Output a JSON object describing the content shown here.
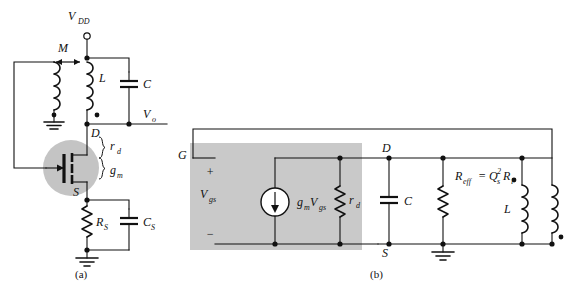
{
  "figure": {
    "background_color": "#ffffff",
    "line_color": "#111111",
    "shade_color": "#c9c9c9"
  },
  "panel_a": {
    "caption": "(a)",
    "labels": {
      "supply": "V",
      "supply_sub": "DD",
      "mutual": "M",
      "inductor": "L",
      "capacitor": "C",
      "output": "V",
      "output_sub": "o",
      "gate": "G",
      "drain": "D",
      "source": "S",
      "rd": "r",
      "rd_sub": "d",
      "gm": "g",
      "gm_sub": "m",
      "source_resistor": "R",
      "source_resistor_sub": "S",
      "source_capacitor": "C",
      "source_capacitor_sub": "S"
    },
    "components": [
      {
        "name": "supply-terminal",
        "type": "open-terminal",
        "label": "V_DD"
      },
      {
        "name": "primary-inductor",
        "type": "inductor",
        "label": "L"
      },
      {
        "name": "secondary-inductor",
        "type": "inductor",
        "label": ""
      },
      {
        "name": "mutual-coupling",
        "type": "coupling-arrow",
        "label": "M"
      },
      {
        "name": "tank-capacitor",
        "type": "capacitor",
        "label": "C"
      },
      {
        "name": "mosfet",
        "type": "n-channel-fet",
        "label": "G/D/S"
      },
      {
        "name": "source-resistor",
        "type": "resistor",
        "label": "R_S"
      },
      {
        "name": "source-capacitor",
        "type": "capacitor",
        "label": "C_S"
      },
      {
        "name": "ground-source",
        "type": "ground",
        "label": ""
      },
      {
        "name": "ground-coil",
        "type": "ground",
        "label": ""
      },
      {
        "name": "fet-parameter-brace",
        "type": "brace",
        "label": "r_d, g_m"
      }
    ]
  },
  "panel_b": {
    "caption": "(b)",
    "labels": {
      "gate": "G",
      "drain": "D",
      "source": "S",
      "vgs": "V",
      "vgs_sub": "gs",
      "plus": "+",
      "minus": "−",
      "gm_vgs": "g",
      "gm_vgs_sub1": "m",
      "gm_vgs_v": "V",
      "gm_vgs_sub2": "gs",
      "rd": "r",
      "rd_sub": "d",
      "capacitor": "C",
      "reff": "R",
      "reff_sub": "eff",
      "reff_eq": "= Q",
      "reff_q_sub": "s",
      "reff_q_sup": "2",
      "reff_rl": "R",
      "reff_rl_sub": "l",
      "inductor": "L"
    },
    "components": [
      {
        "name": "fet-model-box",
        "type": "shaded-region",
        "label": ""
      },
      {
        "name": "dependent-current-source",
        "type": "current-source",
        "label": "g_m V_gs"
      },
      {
        "name": "drain-resistance",
        "type": "resistor",
        "label": "r_d"
      },
      {
        "name": "tank-capacitor",
        "type": "capacitor",
        "label": "C"
      },
      {
        "name": "effective-resistance",
        "type": "resistor",
        "label": "R_eff = Q_s^2 R_l"
      },
      {
        "name": "primary-inductor",
        "type": "inductor",
        "label": "L"
      },
      {
        "name": "secondary-inductor",
        "type": "inductor",
        "label": ""
      },
      {
        "name": "ground-node",
        "type": "ground",
        "label": ""
      },
      {
        "name": "feedback-wire",
        "type": "wire",
        "label": ""
      }
    ]
  }
}
